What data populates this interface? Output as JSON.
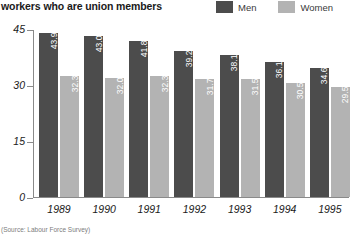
{
  "header": {
    "title": "workers who are union members"
  },
  "legend": {
    "position": "top-right",
    "items": [
      {
        "label": "Men",
        "color": "#4c4c4c",
        "swatch_name": "legend-swatch-men"
      },
      {
        "label": "Women",
        "color": "#b3b3b3",
        "swatch_name": "legend-swatch-women"
      }
    ]
  },
  "source": {
    "text": "(Source: Labour Force Survey)"
  },
  "chart_data": {
    "type": "bar",
    "title": "workers who are union members",
    "subtitle": "",
    "xlabel": "",
    "ylabel": "",
    "grid": false,
    "legend_position": "top-right",
    "ylim": [
      0,
      45
    ],
    "yticks": [
      0,
      15,
      30,
      45
    ],
    "ytick_labels": [
      "0",
      "15",
      "30",
      "45"
    ],
    "categories": [
      "1989",
      "1990",
      "1991",
      "1992",
      "1993",
      "1994",
      "1995"
    ],
    "series": [
      {
        "name": "Men",
        "color": "#4c4c4c",
        "values": [
          43.9,
          43.0,
          41.8,
          39.2,
          38.1,
          36.1,
          34.6
        ],
        "labels": [
          "43.9%",
          "43.0%",
          "41.8%",
          "39.2%",
          "38.1%",
          "36.1%",
          "34.6%"
        ]
      },
      {
        "name": "Women",
        "color": "#b3b3b3",
        "values": [
          32.3,
          32.0,
          32.3,
          31.7,
          31.5,
          30.5,
          29.5
        ],
        "labels": [
          "32.3%",
          "32.0%",
          "32.3%",
          "31.7%",
          "31.5%",
          "30.5%",
          "29.5%"
        ]
      }
    ]
  }
}
